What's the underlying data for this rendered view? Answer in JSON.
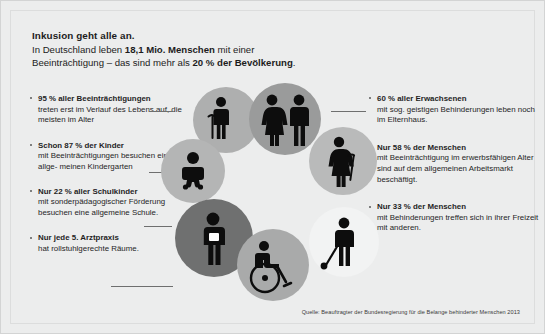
{
  "poster": {
    "background_color": "#eceded",
    "text_color": "#1c1c1c"
  },
  "heading": {
    "title": "Inkusion geht alle an.",
    "line2_pre": "In Deutschland leben ",
    "line2_bold": "18,1 Mio. Menschen",
    "line2_post": " mit einer",
    "line3_pre": "Beeinträchtigung – das sind mehr als ",
    "line3_bold": "20 % der Bevölkerung",
    "line3_post": "."
  },
  "facts_left": [
    {
      "head": "95 % aller Beeinträchtigungen",
      "body": "treten erst im Verlauf des Lebens auf, die meisten im Alter"
    },
    {
      "head": "Schon 87 % der Kinder",
      "body": "mit Beeinträchtigungen besuchen einen allge- meinen Kindergarten"
    },
    {
      "head": "Nur 22 % aller Schulkinder",
      "body": "mit sonderpädagogischer Förderung besuchen eine allgemeine Schule."
    },
    {
      "head": "Nur jede 5. Arztpraxis",
      "body": "hat rollstuhlgerechte Räume."
    }
  ],
  "facts_right": [
    {
      "head": "60 % aller Erwachsenen",
      "body": "mit sog. geistigen Behinderungen leben noch im Elternhaus."
    },
    {
      "head": "Nur 58 % der Menschen",
      "body": "mit Beeinträchtigung im erwerbsfähigen Alter sind auf dem allgemeinen Arbeitsmarkt beschäftigt."
    },
    {
      "head": "Nur 33 % der Menschen",
      "body": "mit Behinderungen treffen sich in ihrer Freizeit mit anderen."
    }
  ],
  "illustration": {
    "bubbles": [
      {
        "name": "elderly-with-cane",
        "color": "#aeafaf"
      },
      {
        "name": "couple-standing",
        "color": "#9a9b9b"
      },
      {
        "name": "woman-with-cane",
        "color": "#b9baba"
      },
      {
        "name": "baby-infant",
        "color": "#b4b5b5"
      },
      {
        "name": "schoolchild",
        "color": "#6f7070"
      },
      {
        "name": "person-wheelchair",
        "color": "#a9aaaa"
      },
      {
        "name": "person-blind-cane",
        "color": "#f2f3f3"
      }
    ]
  },
  "source": {
    "text": "Quelle: Beauftragter der Bundesregierung für die Belange behinderter Menschen 2013"
  }
}
